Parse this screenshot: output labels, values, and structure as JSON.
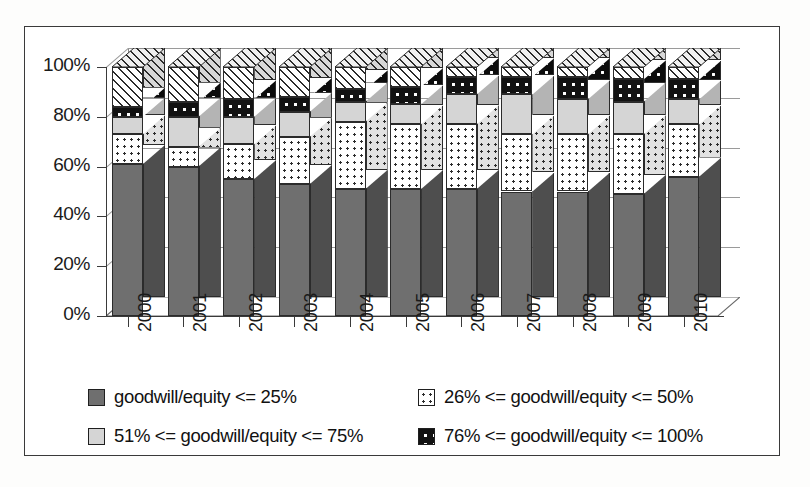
{
  "chart_data": {
    "type": "bar",
    "subtype": "stacked-percentage-3d",
    "title": "",
    "xlabel": "",
    "ylabel": "",
    "ylim": [
      0,
      100
    ],
    "yticks": [
      0,
      20,
      40,
      60,
      80,
      100
    ],
    "ytick_labels": [
      "0%",
      "20%",
      "40%",
      "60%",
      "80%",
      "100%"
    ],
    "grid": true,
    "legend_position": "bottom",
    "categories": [
      "2000",
      "2001",
      "2002",
      "2003",
      "2004",
      "2005",
      "2006",
      "2007",
      "2008",
      "2009",
      "2010"
    ],
    "series": [
      {
        "name": "goodwill/equity <= 25%",
        "pattern": "solid-dark-gray",
        "color": "#6f6f6f",
        "values": [
          61,
          60,
          55,
          53,
          51,
          51,
          51,
          50,
          50,
          49,
          56
        ]
      },
      {
        "name": "26% <= goodwill/equity <= 50%",
        "pattern": "white-with-dots",
        "color": "#ffffff",
        "values": [
          12,
          8,
          14,
          19,
          27,
          26,
          26,
          23,
          23,
          24,
          21
        ]
      },
      {
        "name": "51% <= goodwill/equity <= 75%",
        "pattern": "solid-light-gray",
        "color": "#d5d5d5",
        "values": [
          7,
          12,
          11,
          10,
          8,
          8,
          12,
          16,
          14,
          13,
          10
        ]
      },
      {
        "name": "76% <= goodwill/equity <= 100%",
        "pattern": "black-with-white-dots",
        "color": "#121212",
        "values": [
          4,
          6,
          7,
          6,
          5,
          7,
          7,
          7,
          9,
          9,
          8
        ]
      },
      {
        "name": "remainder",
        "pattern": "diagonal-hatch",
        "color": "#ffffff",
        "values": [
          16,
          14,
          13,
          12,
          9,
          8,
          4,
          4,
          4,
          5,
          5
        ]
      }
    ],
    "cumulative_tops": {
      "2000": [
        61,
        73,
        80,
        84,
        100
      ],
      "2001": [
        60,
        68,
        80,
        86,
        100
      ],
      "2002": [
        55,
        69,
        80,
        87,
        100
      ],
      "2003": [
        53,
        72,
        82,
        88,
        100
      ],
      "2004": [
        51,
        78,
        86,
        91,
        100
      ],
      "2005": [
        51,
        77,
        85,
        92,
        100
      ],
      "2006": [
        51,
        77,
        89,
        96,
        100
      ],
      "2007": [
        50,
        73,
        89,
        96,
        100
      ],
      "2008": [
        50,
        73,
        87,
        96,
        100
      ],
      "2009": [
        49,
        73,
        86,
        95,
        100
      ],
      "2010": [
        56,
        77,
        87,
        95,
        100
      ]
    }
  },
  "legend": {
    "items": [
      {
        "label": "goodwill/equity <= 25%",
        "swatch": "dark-gray-swatch"
      },
      {
        "label": "26% <= goodwill/equity <= 50%",
        "swatch": "dotted-swatch"
      },
      {
        "label": "51% <= goodwill/equity <= 75%",
        "swatch": "light-gray-swatch"
      },
      {
        "label": "76% <= goodwill/equity <= 100%",
        "swatch": "black-dotted-swatch"
      }
    ]
  },
  "colors": {
    "series_1": "#6f6f6f",
    "series_2": "#ffffff",
    "series_3": "#d5d5d5",
    "series_4": "#121212",
    "series_5": "#ffffff",
    "axis": "#3a3a3a",
    "grid": "#9a9a9a",
    "frame": "#3a3a3a"
  }
}
